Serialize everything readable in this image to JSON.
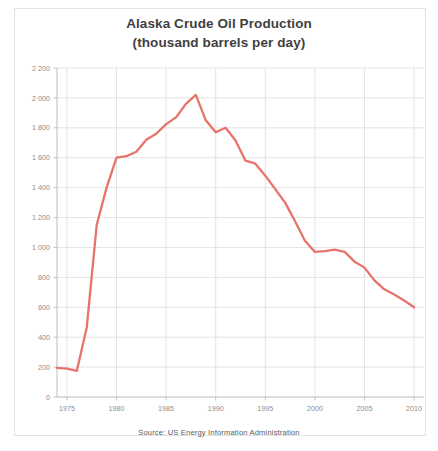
{
  "figure": {
    "title_line1": "Alaska Crude Oil Production",
    "title_line2": "(thousand barrels per day)",
    "source": "Source: US Energy Information Administration",
    "line_color": "#e8736b",
    "grid_color": "#d8d8d8",
    "axis_color": "#b4b4b4",
    "tick_text_color": "#8d8d8d",
    "title_color": "#3f3f3f"
  },
  "chart_data": {
    "type": "line",
    "title": "Alaska Crude Oil Production (thousand barrels per day)",
    "xlabel": "",
    "ylabel": "thousand barrels per day",
    "xlim": [
      1974,
      2011
    ],
    "ylim": [
      0,
      2200
    ],
    "grid": true,
    "legend": null,
    "xticks": [
      "1975",
      "1980",
      "1985",
      "1990",
      "1995",
      "2000",
      "2005",
      "2010"
    ],
    "xtick_values": [
      1975,
      1980,
      1985,
      1990,
      1995,
      2000,
      2005,
      2010
    ],
    "yticks": [
      "0",
      "200",
      "400",
      "600",
      "800",
      "1 000",
      "1 200",
      "1 400",
      "1 600",
      "1 800",
      "2 000",
      "2 200"
    ],
    "ytick_values": [
      0,
      200,
      400,
      600,
      800,
      1000,
      1200,
      1400,
      1600,
      1800,
      2000,
      2200
    ],
    "x": [
      1974,
      1975,
      1976,
      1977,
      1978,
      1979,
      1980,
      1981,
      1982,
      1983,
      1984,
      1985,
      1986,
      1987,
      1988,
      1989,
      1990,
      1991,
      1992,
      1993,
      1994,
      1995,
      1996,
      1997,
      1998,
      1999,
      2000,
      2001,
      2002,
      2003,
      2004,
      2005,
      2006,
      2007,
      2008,
      2009,
      2010
    ],
    "values": [
      195,
      190,
      175,
      465,
      1150,
      1400,
      1600,
      1610,
      1640,
      1720,
      1760,
      1825,
      1870,
      1960,
      2020,
      1850,
      1770,
      1800,
      1715,
      1580,
      1560,
      1480,
      1390,
      1300,
      1175,
      1045,
      970,
      975,
      985,
      970,
      905,
      865,
      780,
      720,
      685,
      645,
      600
    ],
    "peak": {
      "year": 1988,
      "value": 2020
    },
    "start": {
      "year": 1974,
      "value": 195
    },
    "end": {
      "year": 2010,
      "value": 600
    }
  }
}
